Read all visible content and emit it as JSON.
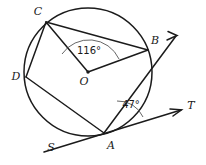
{
  "figure": {
    "type": "geometry-diagram",
    "background_color": "#ffffff",
    "stroke_color": "#1b1b1b",
    "arc_mark_color": "#555555"
  },
  "circle": {
    "center_label": "O",
    "center_x": 88,
    "center_y": 72,
    "radius": 64
  },
  "points": {
    "A": {
      "label": "A",
      "x": 104,
      "y": 133,
      "label_x": 111,
      "label_y": 146
    },
    "B": {
      "label": "B",
      "x": 148,
      "y": 50,
      "label_x": 155,
      "label_y": 41
    },
    "C": {
      "label": "C",
      "x": 46,
      "y": 22,
      "label_x": 38,
      "label_y": 12
    },
    "D": {
      "label": "D",
      "x": 26,
      "y": 77,
      "label_x": 16,
      "label_y": 77
    },
    "O": {
      "label": "O",
      "x": 88,
      "y": 72,
      "label_x": 84,
      "label_y": 82
    },
    "S": {
      "label": "S",
      "x": 50,
      "y": 145,
      "label_x": 51,
      "label_y": 148
    },
    "T": {
      "label": "T",
      "x": 180,
      "y": 110,
      "label_x": 191,
      "label_y": 106
    }
  },
  "angles": {
    "central": {
      "value": "116°",
      "vertex": "O",
      "rays": [
        "C",
        "B"
      ],
      "text_x": 89,
      "text_y": 51
    },
    "tangent_chord": {
      "value": "47°",
      "vertex": "A",
      "rays": [
        "B",
        "T"
      ],
      "text_x": 131,
      "text_y": 105
    }
  },
  "segments": [
    {
      "name": "chord-CB",
      "from": "C",
      "to": "B"
    },
    {
      "name": "chord-CD",
      "from": "C",
      "to": "D"
    },
    {
      "name": "chord-DA",
      "from": "D",
      "to": "A"
    },
    {
      "name": "chord-AB",
      "from": "A",
      "to": "B"
    },
    {
      "name": "radius-OC",
      "from": "O",
      "to": "C"
    },
    {
      "name": "radius-OB",
      "from": "O",
      "to": "B"
    }
  ],
  "rays": [
    {
      "name": "ray-AB-extended",
      "from": "A",
      "through": "B",
      "arrow": true
    },
    {
      "name": "tangent-line-SAT",
      "from": "S",
      "through": "A",
      "to": "T",
      "arrow": true
    }
  ],
  "labels_list": [
    "A",
    "B",
    "C",
    "D",
    "O",
    "S",
    "T"
  ],
  "angle_values": [
    "116°",
    "47°"
  ]
}
